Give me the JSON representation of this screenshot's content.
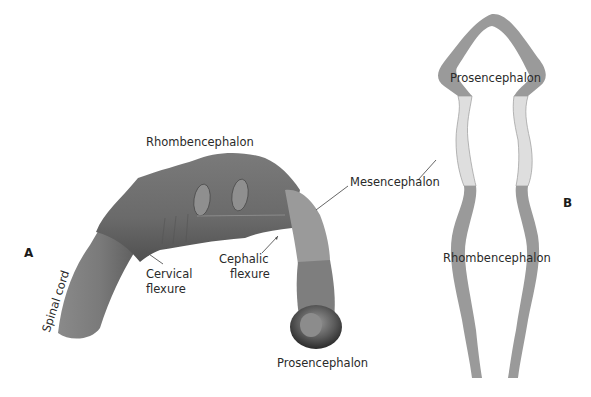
{
  "figure": {
    "panel_a": {
      "letter": "A",
      "labels": {
        "rhombencephalon": "Rhombencephalon",
        "mesencephalon": "Mesencephalon",
        "prosencephalon": "Prosencephalon",
        "spinal_cord": "Spinal cord",
        "cervical_flexure_1": "Cervical",
        "cervical_flexure_2": "flexure",
        "cephalic_flexure_1": "Cephalic",
        "cephalic_flexure_2": "flexure"
      }
    },
    "panel_b": {
      "letter": "B",
      "labels": {
        "prosencephalon": "Prosencephalon",
        "rhombencephalon": "Rhombencephalon"
      }
    },
    "colors": {
      "tube_dark": "#6e6e6e",
      "tube_mid": "#8a8a8a",
      "tube_light": "#a8a8a8",
      "wall_dark": "#9a9a9a",
      "wall_light": "#dcdcdc",
      "leader_line": "#555555"
    }
  }
}
